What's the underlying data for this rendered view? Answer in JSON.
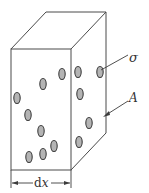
{
  "diagram": {
    "type": "volume-element-with-particles",
    "labels": {
      "sigma": "σ",
      "area": "A",
      "width_d": "d",
      "width_x": "x"
    },
    "colors": {
      "edge": "#4a4a4a",
      "particle_fill": "#b4b4b4",
      "particle_stroke": "#3c3c3c",
      "text": "#333333"
    },
    "front_face_particles": [
      {
        "cx": 62,
        "cy": 74
      },
      {
        "cx": 43,
        "cy": 84
      },
      {
        "cx": 17,
        "cy": 98
      },
      {
        "cx": 28,
        "cy": 115
      },
      {
        "cx": 41,
        "cy": 131
      },
      {
        "cx": 54,
        "cy": 146
      },
      {
        "cx": 29,
        "cy": 157
      },
      {
        "cx": 43,
        "cy": 154
      }
    ],
    "side_face_particles": [
      {
        "cx": 78,
        "cy": 72
      },
      {
        "cx": 100,
        "cy": 72
      },
      {
        "cx": 80,
        "cy": 94
      },
      {
        "cx": 89,
        "cy": 123
      },
      {
        "cx": 79,
        "cy": 142
      }
    ]
  }
}
